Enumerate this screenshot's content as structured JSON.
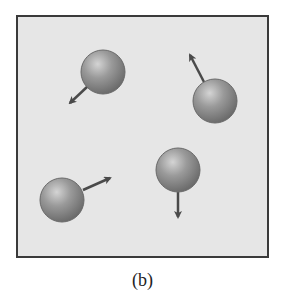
{
  "figure": {
    "caption": "(b)",
    "box": {
      "x": 17,
      "y": 16,
      "width": 251,
      "height": 241,
      "fill": "#e6e6e6",
      "stroke": "#3a3a3a"
    },
    "sphere_color": "#8a8a8a",
    "arrow_color": "#4a4a4a",
    "particles": [
      {
        "cx": 103,
        "cy": 72,
        "r": 22,
        "arrow": {
          "x1": 88,
          "y1": 86,
          "x2": 70,
          "y2": 103
        }
      },
      {
        "cx": 215,
        "cy": 101,
        "r": 22,
        "arrow": {
          "x1": 204,
          "y1": 82,
          "x2": 190,
          "y2": 55
        }
      },
      {
        "cx": 62,
        "cy": 200,
        "r": 22,
        "arrow": {
          "x1": 83,
          "y1": 190,
          "x2": 110,
          "y2": 178
        }
      },
      {
        "cx": 178,
        "cy": 170,
        "r": 22,
        "arrow": {
          "x1": 178,
          "y1": 192,
          "x2": 178,
          "y2": 217
        }
      }
    ]
  }
}
